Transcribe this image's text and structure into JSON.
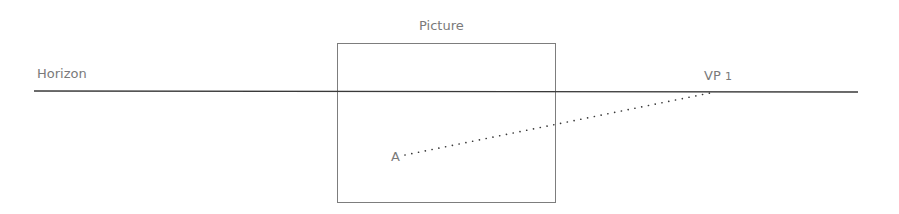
{
  "diagram": {
    "labels": {
      "horizon": "Horizon",
      "picture": "Picture",
      "vp": "VP",
      "vp_index": "1",
      "point_a": "A"
    },
    "colors": {
      "line": "#3a3a3a",
      "frame": "#7d7d7d",
      "text": "#7a7a7a"
    }
  }
}
